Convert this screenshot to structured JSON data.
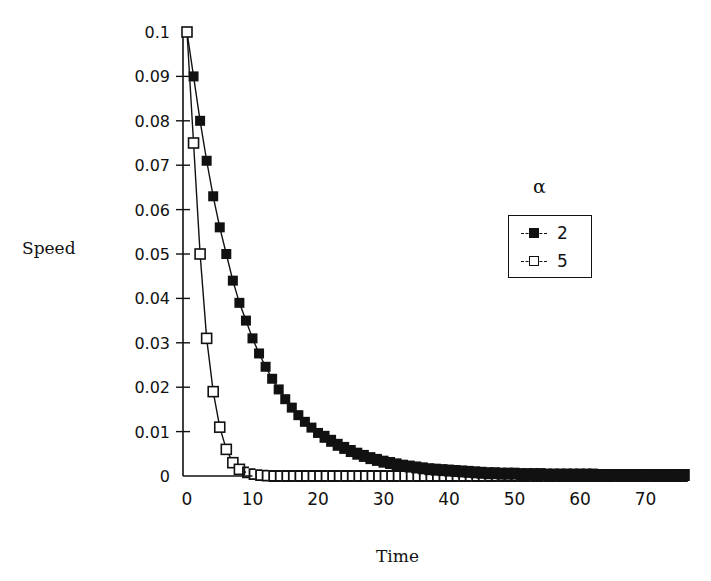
{
  "chart_data": {
    "type": "line",
    "title": "",
    "xlabel": "Time",
    "ylabel": "Speed",
    "xlim": [
      0,
      76
    ],
    "ylim": [
      0,
      0.1
    ],
    "x_ticks": [
      "0",
      "10",
      "20",
      "30",
      "40",
      "50",
      "60",
      "70"
    ],
    "y_ticks": [
      "0",
      "0.01",
      "0.02",
      "0.03",
      "0.04",
      "0.05",
      "0.06",
      "0.07",
      "0.08",
      "0.09",
      "0.1"
    ],
    "grid": false,
    "legend_title": "α",
    "legend_position": "right",
    "series": [
      {
        "name": "2",
        "marker": "filled-square",
        "x_step": 1,
        "values": [
          0.1,
          0.09,
          0.08,
          0.071,
          0.063,
          0.056,
          0.05,
          0.044,
          0.039,
          0.035,
          0.031,
          0.0276,
          0.0246,
          0.0219,
          0.0195,
          0.0173,
          0.0154,
          0.0137,
          0.0122,
          0.0109,
          0.0097,
          0.0086,
          0.0077,
          0.0068,
          0.0061,
          0.0054,
          0.0048,
          0.0043,
          0.0038,
          0.0034,
          0.003,
          0.0027,
          0.0024,
          0.0021,
          0.0019,
          0.0017,
          0.0015,
          0.0013,
          0.0012,
          0.0011,
          0.001,
          0.0009,
          0.0008,
          0.0007,
          0.0006,
          0.0005,
          0.0004,
          0.0004,
          0.0003,
          0.0003,
          0.0003,
          0.0002,
          0.0002,
          0.0002,
          0.0002,
          0.0001,
          0.0001,
          0.0001,
          0.0001,
          0.0001,
          0.0001,
          0.0001,
          0.0001,
          0,
          0,
          0,
          0,
          0,
          0,
          0,
          0,
          0,
          0,
          0,
          0,
          0,
          0
        ]
      },
      {
        "name": "5",
        "marker": "open-square",
        "x_step": 1,
        "values": [
          0.1,
          0.075,
          0.05,
          0.031,
          0.019,
          0.011,
          0.006,
          0.003,
          0.0015,
          0.0008,
          0.0004,
          0.0002,
          0.0001,
          0,
          0,
          0,
          0,
          0,
          0,
          0,
          0,
          0,
          0,
          0,
          0,
          0,
          0,
          0,
          0,
          0,
          0,
          0,
          0,
          0,
          0,
          0,
          0,
          0,
          0,
          0,
          0,
          0,
          0,
          0,
          0,
          0,
          0,
          0,
          0,
          0,
          0,
          0,
          0,
          0,
          0,
          0,
          0,
          0,
          0,
          0,
          0,
          0,
          0,
          0,
          0,
          0,
          0,
          0,
          0,
          0,
          0,
          0,
          0,
          0,
          0,
          0,
          0
        ]
      }
    ]
  },
  "labels": {
    "ylabel": "Speed",
    "xlabel": "Time",
    "legend_title": "α",
    "legend_items": [
      "2",
      "5"
    ]
  }
}
